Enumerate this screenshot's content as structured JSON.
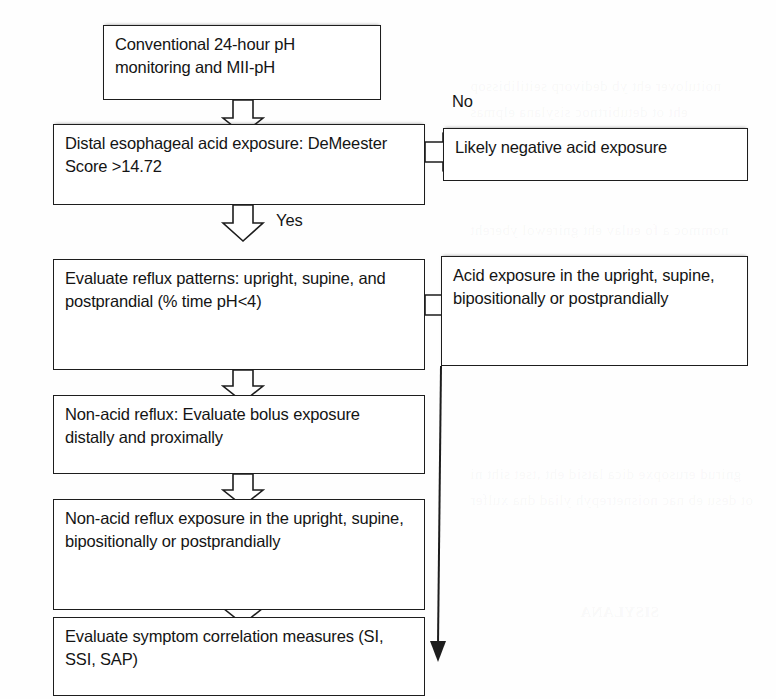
{
  "figure": {
    "type": "flowchart",
    "orientation": "top-to-bottom",
    "background_color": "#fefefe",
    "line_color": "#1d1d1d",
    "text_color": "#141414"
  },
  "nodes": {
    "start": {
      "id": "n1",
      "text": "Conventional 24-hour pH monitoring and MII-pH",
      "shape": "rectangle"
    },
    "decision": {
      "id": "n2",
      "text": "Distal esophageal acid exposure: DeMeester Score >14.72",
      "shape": "rectangle"
    },
    "negative": {
      "id": "n3",
      "text": "Likely negative acid exposure",
      "shape": "rectangle"
    },
    "reflux_patterns": {
      "id": "n4",
      "text": "Evaluate reflux patterns: upright, supine, and postprandial (% time pH<4)",
      "shape": "rectangle"
    },
    "acid_exposure": {
      "id": "n5",
      "text": "Acid exposure in the upright, supine, bipositionally or postprandially",
      "shape": "rectangle"
    },
    "nonacid_bolus": {
      "id": "n6",
      "text": "Non-acid reflux: Evaluate bolus exposure distally and proximally",
      "shape": "rectangle"
    },
    "nonacid_exposure": {
      "id": "n7",
      "text": "Non-acid reflux exposure in the upright, supine, bipositionally or postprandially",
      "shape": "rectangle"
    },
    "symptom_correlation": {
      "id": "n8",
      "text": "Evaluate symptom correlation measures (SI, SSI, SAP)",
      "shape": "rectangle"
    }
  },
  "edge_labels": {
    "no": "No",
    "yes": "Yes"
  },
  "edges": [
    {
      "from": "start",
      "to": "decision",
      "label": "",
      "style": "hollow-block-arrow",
      "direction": "down"
    },
    {
      "from": "decision",
      "to": "negative",
      "label": "No",
      "style": "hollow-block-arrow",
      "direction": "right"
    },
    {
      "from": "decision",
      "to": "reflux_patterns",
      "label": "Yes",
      "style": "hollow-block-arrow",
      "direction": "down"
    },
    {
      "from": "reflux_patterns",
      "to": "acid_exposure",
      "label": "",
      "style": "hollow-block-arrow",
      "direction": "right"
    },
    {
      "from": "reflux_patterns",
      "to": "nonacid_bolus",
      "label": "",
      "style": "hollow-block-arrow",
      "direction": "down"
    },
    {
      "from": "nonacid_bolus",
      "to": "nonacid_exposure",
      "label": "",
      "style": "hollow-block-arrow",
      "direction": "down"
    },
    {
      "from": "nonacid_exposure",
      "to": "symptom_correlation",
      "label": "",
      "style": "hollow-block-arrow",
      "direction": "down"
    },
    {
      "from": "acid_exposure",
      "to": "symptom_correlation",
      "label": "",
      "style": "solid-line-arrow",
      "direction": "down"
    }
  ],
  "bleed_through": [
    "noitulover eht yb dedivorp seitilibissop",
    "eht ot detubirtnoc sisylana elpmas",
    "nommoc a fo eulav eht gnirewol ybereht",
    "erusopxe dica lamixorp eht fo",
    "eht ,ti fo %59 naht retaerg sah",
    "gnirud erusopxe dica latsid eht ,tset siht ni",
    "ot desu eb nac noisnetrepyh yliad dna xulfer",
    "SISYLANA"
  ]
}
